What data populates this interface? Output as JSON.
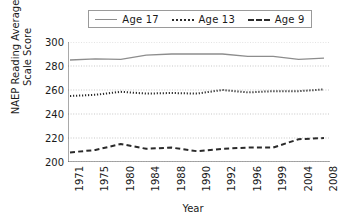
{
  "chart_data": {
    "type": "line",
    "title": "",
    "xlabel": "Year",
    "ylabel": "NAEP Reading Average Scale Score",
    "ylabel_line1": "NAEP Reading Average",
    "ylabel_line2": "Scale Score",
    "categories": [
      "1971",
      "1975",
      "1980",
      "1984",
      "1988",
      "1990",
      "1992",
      "1996",
      "1999",
      "2004",
      "2008"
    ],
    "ylim": [
      200,
      300
    ],
    "yticks": [
      200,
      220,
      240,
      260,
      280,
      300
    ],
    "grid": "horizontal-dotted",
    "legend_position": "top-center",
    "series": [
      {
        "name": "Age 17",
        "style": "solid",
        "color": "#8d8d8d",
        "values": [
          285,
          286,
          285.5,
          289,
          290,
          290,
          290,
          288,
          288,
          285.5,
          286.5
        ]
      },
      {
        "name": "Age 13",
        "style": "dotted",
        "color": "#2a2a2a",
        "values": [
          255,
          256,
          258.5,
          257,
          257.5,
          257,
          260,
          258,
          259,
          259,
          260.5
        ]
      },
      {
        "name": "Age 9",
        "style": "dashed",
        "color": "#2a2a2a",
        "values": [
          208,
          210,
          215,
          211,
          212,
          209,
          211,
          212,
          212,
          219,
          220
        ]
      }
    ]
  },
  "legend": {
    "entries": [
      {
        "label": "Age 17",
        "style": "solid"
      },
      {
        "label": "Age 13",
        "style": "dotted"
      },
      {
        "label": "Age 9",
        "style": "dashed"
      }
    ]
  }
}
